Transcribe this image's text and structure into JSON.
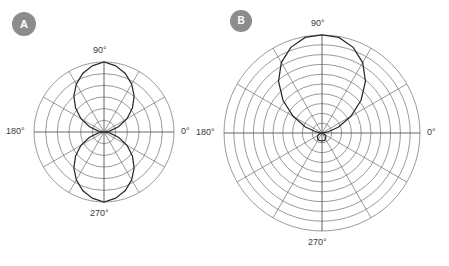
{
  "figure": {
    "background_color": "#ffffff",
    "line_color": "#6e6e6e",
    "curve_color": "#2a2a2a",
    "badge_color": "#8c8c8c",
    "label_color": "#3a3a3a"
  },
  "panels": [
    {
      "id": "A",
      "badge_label": "A",
      "pattern_name": "figure-eight dipole pattern",
      "center": {
        "x": 104,
        "y": 132
      },
      "radius": 70,
      "rings": 6,
      "spokes": 12,
      "spoke_step_deg": 30,
      "labels": {
        "top": "90°",
        "right": "0°",
        "bottom": "270°",
        "left": "180°"
      }
    },
    {
      "id": "B",
      "badge_label": "B",
      "pattern_name": "directional cardioid pattern",
      "center": {
        "x": 98,
        "y": 133
      },
      "radius": 98,
      "rings": 10,
      "spokes": 12,
      "spoke_step_deg": 30,
      "labels": {
        "top": "90°",
        "right": "0°",
        "bottom": "270°",
        "left": "180°"
      }
    }
  ],
  "chart_data": [
    {
      "type": "line",
      "subtype": "polar",
      "panel": "A",
      "title": "",
      "xlabel": "",
      "ylabel": "",
      "grid": true,
      "legend_position": "none",
      "angle_unit": "degrees",
      "angle_ticks": [
        0,
        30,
        60,
        90,
        120,
        150,
        180,
        210,
        240,
        270,
        300,
        330
      ],
      "tick_labels": [
        "0°",
        "90°",
        "180°",
        "270°"
      ],
      "radial_range": [
        0,
        1
      ],
      "radial_rings": 6,
      "series": [
        {
          "name": "figure-eight lobe pattern",
          "description": "Two symmetric lobes peaking at 90 and 270 degrees, nulls at 0 and 180 degrees",
          "formula": "r = |sin(theta)|^1.4",
          "theta": [
            0,
            10,
            20,
            30,
            40,
            50,
            60,
            70,
            80,
            90,
            100,
            110,
            120,
            130,
            140,
            150,
            160,
            170,
            180,
            190,
            200,
            210,
            220,
            230,
            240,
            250,
            260,
            270,
            280,
            290,
            300,
            310,
            320,
            330,
            340,
            350,
            360
          ],
          "r": [
            0.0,
            0.08,
            0.22,
            0.38,
            0.53,
            0.67,
            0.79,
            0.89,
            0.96,
            1.0,
            0.96,
            0.89,
            0.79,
            0.67,
            0.53,
            0.38,
            0.22,
            0.08,
            0.0,
            0.08,
            0.22,
            0.38,
            0.53,
            0.67,
            0.79,
            0.89,
            0.96,
            1.0,
            0.96,
            0.89,
            0.79,
            0.67,
            0.53,
            0.38,
            0.22,
            0.08,
            0.0
          ]
        }
      ]
    },
    {
      "type": "line",
      "subtype": "polar",
      "panel": "B",
      "title": "",
      "xlabel": "",
      "ylabel": "",
      "grid": true,
      "legend_position": "none",
      "angle_unit": "degrees",
      "angle_ticks": [
        0,
        30,
        60,
        90,
        120,
        150,
        180,
        210,
        240,
        270,
        300,
        330
      ],
      "tick_labels": [
        "0°",
        "90°",
        "180°",
        "270°"
      ],
      "radial_range": [
        0,
        1
      ],
      "radial_rings": 10,
      "series": [
        {
          "name": "directional main lobe with small back lobe",
          "description": "Single large main lobe toward 90 degrees, very small back lobe toward 270 degrees",
          "formula": "r = main lobe sin-shaped toward 90 deg, back lobe about 8 percent amplitude",
          "theta": [
            0,
            10,
            20,
            30,
            40,
            50,
            60,
            70,
            80,
            90,
            100,
            110,
            120,
            130,
            140,
            150,
            160,
            170,
            180,
            190,
            200,
            210,
            220,
            230,
            240,
            250,
            260,
            270,
            280,
            290,
            300,
            310,
            320,
            330,
            340,
            350,
            360
          ],
          "r": [
            0.0,
            0.06,
            0.18,
            0.34,
            0.52,
            0.69,
            0.83,
            0.93,
            0.99,
            1.0,
            0.99,
            0.93,
            0.83,
            0.69,
            0.52,
            0.34,
            0.18,
            0.06,
            0.0,
            0.01,
            0.03,
            0.05,
            0.06,
            0.07,
            0.08,
            0.08,
            0.08,
            0.08,
            0.08,
            0.08,
            0.07,
            0.06,
            0.05,
            0.03,
            0.01,
            0.0,
            0.0
          ]
        }
      ]
    }
  ]
}
